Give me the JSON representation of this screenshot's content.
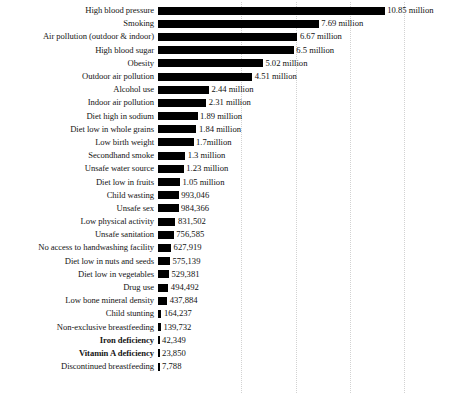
{
  "chart_data": {
    "type": "bar",
    "orientation": "horizontal",
    "title": "",
    "subtitle": "",
    "xlabel": "",
    "ylabel": "",
    "xlim": [
      0,
      11.4
    ],
    "grid": "vertical-dotted",
    "legend": "none",
    "unit": "deaths",
    "value_axis_px_per_million": 20.9,
    "gridline_values": [
      3.8,
      6.4,
      9.0,
      11.6
    ],
    "categories": [
      "High blood pressure",
      "Smoking",
      "Air pollution (outdoor & indoor)",
      "High blood sugar",
      "Obesity",
      "Outdoor air pollution",
      "Alcohol use",
      "Indoor air pollution",
      "Diet high in sodium",
      "Diet low in whole grains",
      "Low birth weight",
      "Secondhand smoke",
      "Unsafe water source",
      "Diet low in fruits",
      "Child wasting",
      "Unsafe sex",
      "Low physical activity",
      "Unsafe sanitation",
      "No access to handwashing facility",
      "Diet low in nuts and seeds",
      "Diet low in vegetables",
      "Drug use",
      "Low bone mineral density",
      "Child stunting",
      "Non-exclusive breastfeeding",
      "Iron deficiency",
      "Vitamin A deficiency",
      "Discontinued breastfeeding"
    ],
    "values": [
      10850000,
      7690000,
      6670000,
      6500000,
      5020000,
      4510000,
      2440000,
      2310000,
      1890000,
      1840000,
      1700000,
      1300000,
      1230000,
      1050000,
      993046,
      984366,
      831502,
      756585,
      627919,
      575139,
      529381,
      494492,
      437884,
      164237,
      139732,
      42349,
      23850,
      7788
    ],
    "value_labels": [
      "10.85 million",
      "7.69 million",
      "6.67 million",
      "6.5 million",
      "5.02 million",
      "4.51 million",
      "2.44 million",
      "2.31 million",
      "1.89 million",
      "1.84 million",
      "1.7million",
      "1.3 million",
      "1.23 million",
      "1.05 million",
      "993,046",
      "984,366",
      "831,502",
      "756,585",
      "627,919",
      "575,139",
      "529,381",
      "494,492",
      "437,884",
      "164,237",
      "139,732",
      "42,349",
      "23,850",
      "7,788"
    ],
    "emphasized_categories": [
      "Iron deficiency",
      "Vitamin A deficiency"
    ],
    "bar_color": "#000000",
    "gridline_color": "#d2d2d2",
    "background_color": "#ffffff"
  }
}
